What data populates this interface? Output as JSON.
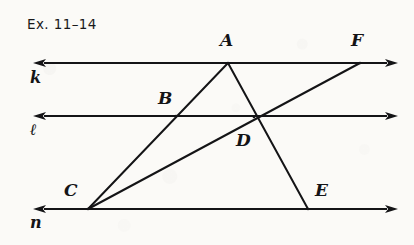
{
  "figure": {
    "caption": "Ex. 11–14",
    "width": 414,
    "height": 245,
    "background_color": "#fbfaf7",
    "ink_color": "#141416"
  },
  "lines": [
    {
      "id": "k",
      "label": "k",
      "label_x": 30,
      "label_y": 70,
      "y": 63,
      "x1": 33,
      "x2": 398,
      "arrow_left": true,
      "arrow_right": true
    },
    {
      "id": "l",
      "label": "ℓ",
      "label_x": 30,
      "label_y": 122,
      "y": 116,
      "x1": 33,
      "x2": 398,
      "arrow_left": true,
      "arrow_right": true
    },
    {
      "id": "n",
      "label": "n",
      "label_x": 30,
      "label_y": 215,
      "y": 209,
      "x1": 33,
      "x2": 398,
      "arrow_left": true,
      "arrow_right": true
    }
  ],
  "points": [
    {
      "id": "A",
      "label": "A",
      "x": 228,
      "y": 63,
      "label_x": 220,
      "label_y": 32
    },
    {
      "id": "B",
      "label": "B",
      "x": 176,
      "y": 116,
      "label_x": 158,
      "label_y": 90
    },
    {
      "id": "C",
      "label": "C",
      "x": 88,
      "y": 209,
      "label_x": 64,
      "label_y": 182
    },
    {
      "id": "D",
      "label": "D",
      "x": 254,
      "y": 117,
      "label_x": 236,
      "label_y": 132
    },
    {
      "id": "E",
      "label": "E",
      "x": 308,
      "y": 209,
      "label_x": 315,
      "label_y": 182
    },
    {
      "id": "F",
      "label": "F",
      "x": 360,
      "y": 63,
      "label_x": 351,
      "label_y": 32
    }
  ],
  "segments": [
    {
      "id": "CA",
      "from": "C",
      "to": "A",
      "note": "transversal through B"
    },
    {
      "id": "CF",
      "from": "C",
      "to": "F",
      "note": "transversal through D"
    },
    {
      "id": "AE",
      "from": "A",
      "to": "E",
      "note": "transversal through D"
    }
  ]
}
